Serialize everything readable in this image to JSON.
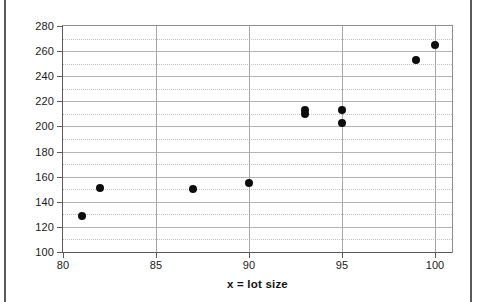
{
  "chart_data": {
    "type": "scatter",
    "title": "",
    "xlabel": "x = lot size",
    "ylabel": "Y = production cost",
    "xlim": [
      80,
      101
    ],
    "ylim": [
      100,
      280
    ],
    "xticks": [
      80,
      85,
      90,
      95,
      100
    ],
    "yticks": [
      100,
      120,
      140,
      160,
      180,
      200,
      220,
      240,
      260,
      280
    ],
    "xtick_labels": [
      "80",
      "85",
      "90",
      "95",
      "100"
    ],
    "ytick_labels": [
      "100",
      "120",
      "140",
      "160",
      "180",
      "200",
      "220",
      "240",
      "260",
      "280"
    ],
    "grid": true,
    "legend": null,
    "marker": "filled-circle",
    "marker_color": "#0d0d0d",
    "points": [
      {
        "x": 81,
        "y": 129
      },
      {
        "x": 82,
        "y": 151
      },
      {
        "x": 87,
        "y": 150
      },
      {
        "x": 90,
        "y": 155
      },
      {
        "x": 93,
        "y": 210
      },
      {
        "x": 93,
        "y": 213
      },
      {
        "x": 95,
        "y": 203
      },
      {
        "x": 95,
        "y": 213
      },
      {
        "x": 99,
        "y": 253
      },
      {
        "x": 100,
        "y": 265
      }
    ]
  },
  "axes": {
    "x_title": "x = lot size",
    "y_title": "Y = production cost"
  },
  "colors": {
    "marker": "#0d0d0d",
    "gridline": "#b4b4b4",
    "axis": "#5b5b5b",
    "background": "#ffffff"
  }
}
